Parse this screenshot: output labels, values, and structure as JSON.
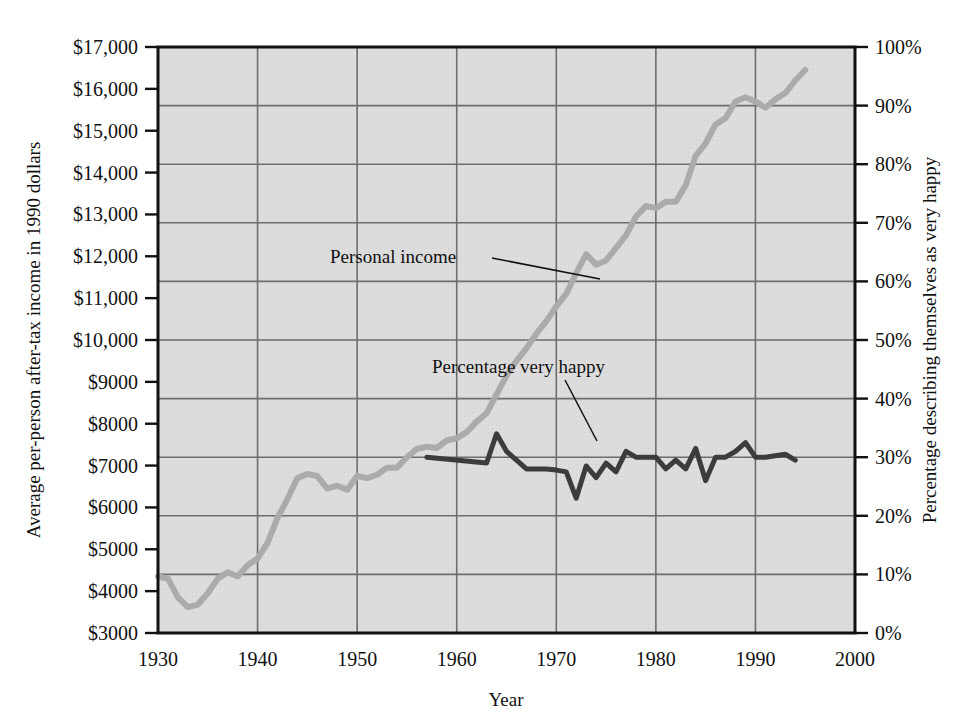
{
  "chart_data": {
    "type": "line",
    "title": "",
    "xlabel": "Year",
    "ylabel_left": "Average per-person after-tax income in 1990 dollars",
    "ylabel_right": "Percentage describing themselves as very happy",
    "xlim": [
      1930,
      2000
    ],
    "xticks": [
      "1930",
      "1940",
      "1950",
      "1960",
      "1970",
      "1980",
      "1990",
      "2000"
    ],
    "xtick_values": [
      1930,
      1940,
      1950,
      1960,
      1970,
      1980,
      1990,
      2000
    ],
    "ylim_left": [
      3000,
      17000
    ],
    "yticks_left": [
      "$3000",
      "$4000",
      "$5000",
      "$6000",
      "$7000",
      "$8000",
      "$9000",
      "$10,000",
      "$11,000",
      "$12,000",
      "$13,000",
      "$14,000",
      "$15,000",
      "$16,000",
      "$17,000"
    ],
    "ytick_values_left": [
      3000,
      4000,
      5000,
      6000,
      7000,
      8000,
      9000,
      10000,
      11000,
      12000,
      13000,
      14000,
      15000,
      16000,
      17000
    ],
    "ylim_right": [
      0,
      100
    ],
    "yticks_right": [
      "0%",
      "10%",
      "20%",
      "30%",
      "40%",
      "50%",
      "60%",
      "70%",
      "80%",
      "90%",
      "100%"
    ],
    "ytick_values_right": [
      0,
      10,
      20,
      30,
      40,
      50,
      60,
      70,
      80,
      90,
      100
    ],
    "grid": "horizontal-and-vertical",
    "plot_background": "#dcdcdc",
    "legend": "inline-annotations",
    "series": [
      {
        "name": "Personal income",
        "axis": "left",
        "color": "#ababab",
        "width": 6,
        "points": [
          [
            1930,
            4350
          ],
          [
            1931,
            4300
          ],
          [
            1932,
            3850
          ],
          [
            1933,
            3620
          ],
          [
            1934,
            3680
          ],
          [
            1935,
            3950
          ],
          [
            1936,
            4300
          ],
          [
            1937,
            4450
          ],
          [
            1938,
            4350
          ],
          [
            1939,
            4620
          ],
          [
            1940,
            4780
          ],
          [
            1941,
            5150
          ],
          [
            1942,
            5750
          ],
          [
            1943,
            6200
          ],
          [
            1944,
            6700
          ],
          [
            1945,
            6800
          ],
          [
            1946,
            6750
          ],
          [
            1947,
            6450
          ],
          [
            1948,
            6520
          ],
          [
            1949,
            6420
          ],
          [
            1950,
            6750
          ],
          [
            1951,
            6700
          ],
          [
            1952,
            6780
          ],
          [
            1953,
            6950
          ],
          [
            1954,
            6950
          ],
          [
            1955,
            7200
          ],
          [
            1956,
            7400
          ],
          [
            1957,
            7450
          ],
          [
            1958,
            7420
          ],
          [
            1959,
            7600
          ],
          [
            1960,
            7650
          ],
          [
            1961,
            7800
          ],
          [
            1962,
            8050
          ],
          [
            1963,
            8250
          ],
          [
            1964,
            8700
          ],
          [
            1965,
            9150
          ],
          [
            1966,
            9500
          ],
          [
            1967,
            9800
          ],
          [
            1968,
            10150
          ],
          [
            1969,
            10450
          ],
          [
            1970,
            10800
          ],
          [
            1971,
            11100
          ],
          [
            1972,
            11600
          ],
          [
            1973,
            12050
          ],
          [
            1974,
            11800
          ],
          [
            1975,
            11900
          ],
          [
            1976,
            12200
          ],
          [
            1977,
            12500
          ],
          [
            1978,
            12950
          ],
          [
            1979,
            13200
          ],
          [
            1980,
            13150
          ],
          [
            1981,
            13300
          ],
          [
            1982,
            13300
          ],
          [
            1983,
            13700
          ],
          [
            1984,
            14400
          ],
          [
            1985,
            14700
          ],
          [
            1986,
            15150
          ],
          [
            1987,
            15300
          ],
          [
            1988,
            15700
          ],
          [
            1989,
            15800
          ],
          [
            1990,
            15700
          ],
          [
            1991,
            15550
          ],
          [
            1992,
            15750
          ],
          [
            1993,
            15900
          ],
          [
            1994,
            16200
          ],
          [
            1995,
            16450
          ]
        ]
      },
      {
        "name": "Percentage very happy",
        "axis": "right",
        "color": "#3c3c3c",
        "width": 5,
        "points": [
          [
            1957,
            30.0
          ],
          [
            1963,
            29.0
          ],
          [
            1964,
            34.0
          ],
          [
            1965,
            31.0
          ],
          [
            1966,
            29.5
          ],
          [
            1967,
            28.0
          ],
          [
            1968,
            28.0
          ],
          [
            1969,
            28.0
          ],
          [
            1970,
            27.8
          ],
          [
            1971,
            27.5
          ],
          [
            1972,
            23.0
          ],
          [
            1973,
            28.5
          ],
          [
            1974,
            26.5
          ],
          [
            1975,
            29.0
          ],
          [
            1976,
            27.5
          ],
          [
            1977,
            31.0
          ],
          [
            1978,
            30.0
          ],
          [
            1979,
            30.0
          ],
          [
            1980,
            30.0
          ],
          [
            1981,
            28.0
          ],
          [
            1982,
            29.5
          ],
          [
            1983,
            28.0
          ],
          [
            1984,
            31.5
          ],
          [
            1985,
            26.0
          ],
          [
            1986,
            30.0
          ],
          [
            1987,
            30.0
          ],
          [
            1988,
            31.0
          ],
          [
            1989,
            32.5
          ],
          [
            1990,
            30.0
          ],
          [
            1991,
            30.0
          ],
          [
            1993,
            30.5
          ],
          [
            1994,
            29.5
          ]
        ]
      }
    ],
    "annotations": [
      {
        "text": "Personal income",
        "label_x": 330,
        "label_y": 263,
        "leader": [
          [
            492,
            258
          ],
          [
            600,
            279
          ]
        ]
      },
      {
        "text": "Percentage very happy",
        "label_x": 432,
        "label_y": 373,
        "leader": [
          [
            565,
            380
          ],
          [
            597,
            441
          ]
        ]
      }
    ]
  }
}
